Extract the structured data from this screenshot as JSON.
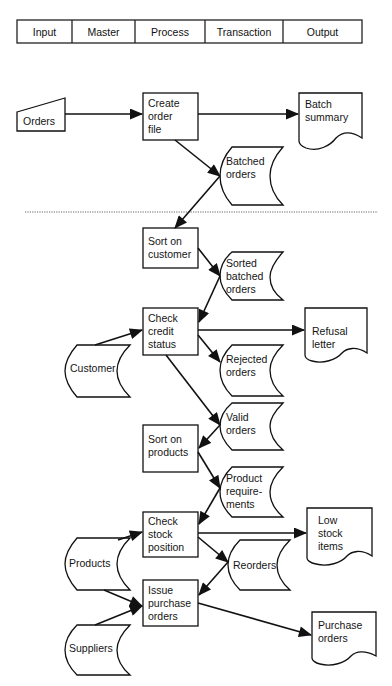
{
  "header": {
    "columns": [
      "Input",
      "Master",
      "Process",
      "Transaction",
      "Output"
    ]
  },
  "stages": {
    "batch": {
      "inputs": {
        "orders": "Orders"
      },
      "processes": {
        "create_order_file": "Create\norder\nfile"
      },
      "transactions": {
        "batched_orders": "Batched\norders"
      },
      "outputs": {
        "batch_summary": "Batch\nsummary"
      }
    },
    "processing": {
      "masters": {
        "customer": "Customer",
        "products": "Products",
        "suppliers": "Suppliers"
      },
      "processes": {
        "sort_on_customer": "Sort on\ncustomer",
        "check_credit_status": "Check\ncredit\nstatus",
        "sort_on_products": "Sort on\nproducts",
        "check_stock_position": "Check\nstock\nposition",
        "issue_purchase_orders": "Issue\npurchase\norders"
      },
      "transactions": {
        "sorted_batched_orders": "Sorted\nbatched\norders",
        "rejected_orders": "Rejected\norders",
        "valid_orders": "Valid\norders",
        "product_requirements": "Product\nrequire-\nments",
        "reorders": "Reorders"
      },
      "outputs": {
        "refusal_letter": "Refusal\nletter",
        "low_stock_items": "Low\nstock\nitems",
        "purchase_orders": "Purchase\norders"
      }
    }
  },
  "flows": [
    [
      "Orders",
      "Create order file"
    ],
    [
      "Create order file",
      "Batch summary"
    ],
    [
      "Create order file",
      "Batched orders"
    ],
    [
      "Batched orders",
      "Sort on customer"
    ],
    [
      "Sort on customer",
      "Sorted batched orders"
    ],
    [
      "Sorted batched orders",
      "Check credit status"
    ],
    [
      "Customer",
      "Check credit status"
    ],
    [
      "Check credit status",
      "Refusal letter"
    ],
    [
      "Check credit status",
      "Rejected orders"
    ],
    [
      "Check credit status",
      "Valid orders"
    ],
    [
      "Valid orders",
      "Sort on products"
    ],
    [
      "Sort on products",
      "Product requirements"
    ],
    [
      "Product requirements",
      "Check stock position"
    ],
    [
      "Products",
      "Check stock position"
    ],
    [
      "Check stock position",
      "Low stock items"
    ],
    [
      "Check stock position",
      "Reorders"
    ],
    [
      "Reorders",
      "Issue purchase orders"
    ],
    [
      "Products",
      "Issue purchase orders"
    ],
    [
      "Suppliers",
      "Issue purchase orders"
    ],
    [
      "Issue purchase orders",
      "Purchase orders"
    ]
  ],
  "colors": {
    "ink": "#111111",
    "background": "#ffffff",
    "divider": "#777777"
  }
}
